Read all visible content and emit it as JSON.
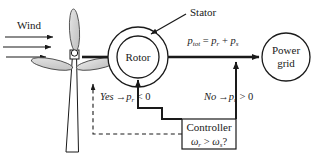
{
  "diagram": {
    "type": "schematic-block-diagram",
    "background_color": "#ffffff",
    "line_color": "#1a1a1a",
    "blade_fill": "#d9d9d9",
    "labels": {
      "wind": "Wind",
      "stator": "Stator",
      "rotor": "Rotor",
      "power_grid_line1": "Power",
      "power_grid_line2": "grid",
      "controller_line1": "Controller",
      "controller_line2_omega_r": "ω",
      "controller_line2_omega_r_sub": "r",
      "controller_line2_gt": " > ",
      "controller_line2_omega_s": "ω",
      "controller_line2_omega_s_sub": "s",
      "controller_line2_q": "?",
      "ptot_p": "p",
      "ptot_sub": "tot",
      "ptot_eq": " = ",
      "ptot_pr": "p",
      "ptot_pr_sub": "r",
      "ptot_plus": " + ",
      "ptot_ps": "p",
      "ptot_ps_sub": "s",
      "yes": "Yes",
      "yes_arrow": "→",
      "yes_p": "p",
      "yes_p_sub": "r",
      "yes_rel": " < 0",
      "no": "No",
      "no_arrow": "→",
      "no_p": "p",
      "no_p_sub": "r",
      "no_rel": " > 0"
    },
    "nodes": [
      {
        "name": "wind-turbine",
        "kind": "turbine",
        "blades": 3
      },
      {
        "name": "stator-ring",
        "kind": "circle-outer",
        "cx": 138,
        "cy": 57,
        "r": 30
      },
      {
        "name": "rotor-circle",
        "kind": "circle-inner",
        "cx": 138,
        "cy": 57,
        "r": 21
      },
      {
        "name": "power-grid-circle",
        "kind": "circle",
        "cx": 286,
        "cy": 57,
        "r": 24
      },
      {
        "name": "controller-box",
        "kind": "rect",
        "x": 182,
        "y": 119,
        "w": 54,
        "h": 30
      }
    ],
    "connections": [
      {
        "name": "wind-arrow-1",
        "style": "solid-arrow",
        "direction": "right"
      },
      {
        "name": "wind-arrow-2",
        "style": "solid-arrow",
        "direction": "right"
      },
      {
        "name": "wind-arrow-3",
        "style": "solid-arrow",
        "direction": "right"
      },
      {
        "name": "shaft-line",
        "style": "solid-thick",
        "from": "wind-turbine",
        "to": "stator-ring"
      },
      {
        "name": "stator-to-grid-line",
        "style": "solid-arrow",
        "from": "stator-ring",
        "to": "power-grid-circle"
      },
      {
        "name": "controller-to-rotor-arrow",
        "style": "solid-arrow",
        "from": "controller-box",
        "to": "rotor-circle"
      },
      {
        "name": "controller-to-grid-arrow",
        "style": "solid-arrow",
        "from": "controller-box",
        "to": "stator-to-grid-line"
      },
      {
        "name": "feedback-dashed-line",
        "style": "dashed-arrow",
        "from": "controller-box",
        "to": "rotor-circle"
      },
      {
        "name": "stator-leader-line",
        "style": "solid-arrow",
        "from": "stator-label",
        "to": "stator-ring"
      }
    ]
  }
}
